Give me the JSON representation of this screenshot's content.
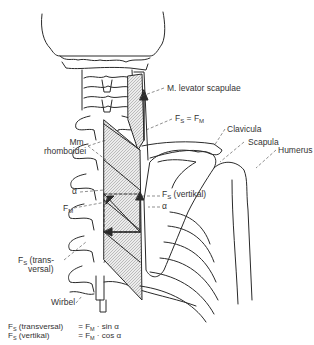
{
  "labels": {
    "levator": "M. levator scapulae",
    "fs_eq_fm": {
      "left": "F",
      "left_sub": "S",
      "eq": " = ",
      "right": "F",
      "right_sub": "M"
    },
    "clavicula": "Clavicula",
    "scapula": "Scapula",
    "rhomboidei_1": "Mm.",
    "rhomboidei_2": "rhomboidei",
    "humerus": "Humerus",
    "alpha_left": "α",
    "alpha_right": "α",
    "fm": {
      "main": "F",
      "sub": "M"
    },
    "fs_vertikal": {
      "main": "F",
      "sub": "S",
      "rest": " (vertikal)"
    },
    "fs_trans": {
      "main": "F",
      "sub": "S",
      "rest": " (trans-",
      "line2": "versal)"
    },
    "wirbel": "Wirbel"
  },
  "formulas": [
    {
      "lhs_main": "F",
      "lhs_sub": "S",
      "lhs_rest": " (transversal)",
      "eq": "= ",
      "rhs_main": "F",
      "rhs_sub": "M",
      "rhs_rest": " · sin α"
    },
    {
      "lhs_main": "F",
      "lhs_sub": "S",
      "lhs_rest": " (vertikal)",
      "eq": "= ",
      "rhs_main": "F",
      "rhs_sub": "M",
      "rhs_rest": " · cos α"
    }
  ],
  "colors": {
    "line": "#2a2a2a",
    "hatch": "#9a9a9a",
    "fill": "#e6e6e6"
  }
}
